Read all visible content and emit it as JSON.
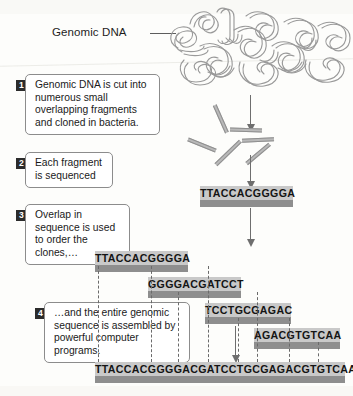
{
  "figure": {
    "label_genomic_dna": "Genomic DNA",
    "icon_dna_tangle": "dna-tangle-icon"
  },
  "steps": [
    {
      "number": "1",
      "text": "Genomic DNA is cut into numerous small overlapping fragments and cloned in bacteria."
    },
    {
      "number": "2",
      "text": "Each fragment is sequenced"
    },
    {
      "number": "3",
      "text": "Overlap in sequence is used to order the clones,…"
    },
    {
      "number": "4",
      "text": "…and the entire genomic sequence is assembled by powerful computer programs."
    }
  ],
  "sequenced_fragment": {
    "text": "TTACCACGGGGA"
  },
  "ordered_clones": [
    {
      "text": "TTACCACGGGGA"
    },
    {
      "text": "GGGGACGATCCT"
    },
    {
      "text": "TCCTGCGAGAC"
    },
    {
      "text": "AGACGTGTCAA"
    }
  ],
  "assembled_sequence": {
    "text": "TTACCACGGGGACGATCCTGCGAGACGTGTCAA"
  },
  "colors": {
    "seq_text_band": "#c9c9c9",
    "seq_body_band": "#8e8e8e",
    "fragment_gray": "#b9b9b9",
    "arrow_gray": "#6e6e6e",
    "box_border": "#8c8c8c",
    "step_num_bg": "#2b2b2b",
    "page_bg": "#fdfdfb"
  }
}
